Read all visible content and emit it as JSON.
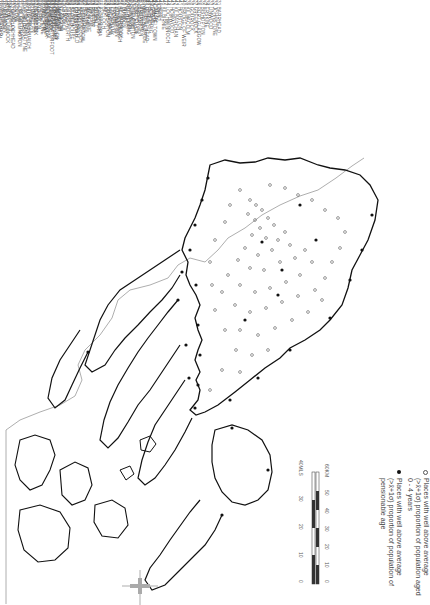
{
  "map": {
    "orientation": "rotated 90 degrees clockwise",
    "coast_color": "#1a1a1a",
    "boundary_color": "#888888"
  },
  "legend": {
    "items": [
      {
        "marker": "open-circle",
        "text": "Places with well above average (>x̄+1σ) proportion of population aged 0 - 4 years"
      },
      {
        "marker": "filled-circle",
        "text": "Places with well above average (>x̄+1σ) proportion of population of pensionable age"
      }
    ]
  },
  "scale": {
    "miles_label": "40MLS",
    "km_label": "60KM",
    "miles_ticks": [
      "0",
      "10",
      "20",
      "30",
      "40MLS"
    ],
    "km_ticks": [
      "0",
      "10",
      "20",
      "30",
      "40",
      "50",
      "60KM"
    ]
  },
  "place_lists": [
    {
      "items": [
        "1 OBAN",
        "2 CAMPBELTOWN",
        "3 ARDRISHAIG",
        "4 LOCHGILPHEAD",
        "5 INVERARAY",
        "6 TARBERT",
        "7 PORT ELLEN",
        "8 BOWMORE",
        "9 ROTHESAY",
        "10 DUNOON",
        "11 HELENSBURGH",
        "12 CARDROSS",
        "13 CLYDEBANK",
        "14 DUMBARTON",
        "15 BALLOCH",
        "16 ALEXANDRIA",
        "17 BONHILL",
        "18 RENTON",
        "19 MILNGAVIE",
        "20 BEARSDEN",
        "21 KIRKINTILLOCH",
        "22 CUMBERNAULD",
        "23 KILSYTH",
        "24 STEPPS",
        "25 LENZIE",
        "26 GLASGOW",
        "27 RUTHERGLEN",
        "28 CAMBUSLANG",
        "29 PAISLEY",
        "30 RENFREW"
      ]
    },
    {
      "items": [
        "31 BARRHEAD",
        "32 JOHNSTONE",
        "33 LINWOOD",
        "34 ERSKINE",
        "35 BISHOPTON",
        "36 PORT GLASGOW",
        "37 GREENOCK",
        "38 GOUROCK",
        "39 KILMACOLM",
        "40 BRIDGE OF WEIR",
        "41 HOUSTON",
        "42 KILBARCHAN",
        "43 HOWWOOD",
        "44 LOCHWINNOCH",
        "45 KILBIRNIE",
        "46 BEITH",
        "47 DALRY",
        "48 LARGS",
        "49 FAIRLIE",
        "50 WEST KILBRIDE",
        "51 ARDROSSAN",
        "52 SALTCOATS",
        "53 STEVENSTON",
        "54 KILWINNING",
        "55 IRVINE",
        "56 KILMARNOCK",
        "57 STEWARTON",
        "58 TROON",
        "59 PRESTWICK",
        "60 AYR"
      ]
    },
    {
      "items": [
        "61 MAYBOLE",
        "62 GIRVAN",
        "63 CUMNOCK",
        "64 AUCHINLECK",
        "65 MAUCHLINE",
        "66 GALSTON",
        "67 NEWMILNS",
        "68 DARVEL",
        "69 HURLFORD",
        "70 KILMAURS",
        "71 DALMELLINGTON",
        "72 PATNA",
        "73 DRONGAN",
        "74 NEW CUMNOCK",
        "75 MUIRKIRK",
        "76 STRATHAVEN",
        "77 EAST KILBRIDE",
        "78 HAMILTON",
        "79 MOTHERWELL",
        "80 WISHAW",
        "81 COATBRIDGE",
        "82 AIRDRIE",
        "83 BELLSHILL",
        "84 UDDINGSTON",
        "85 BOTHWELL",
        "86 BLANTYRE",
        "87 LARKHALL",
        "88 CARLUKE",
        "89 LANARK",
        "90 BIGGAR"
      ]
    },
    {
      "items": [
        "91 CARSTAIRS",
        "92 FORTH",
        "93 SHOTTS",
        "94 HARTHILL",
        "95 LESMAHAGOW",
        "96 DOUGLAS",
        "97 CROSSFORD",
        "98 STONEHOUSE",
        "99 LARGS NORTH",
        "100 BRODICK",
        "101 LAMLASH",
        "102 WHITING BAY",
        "103 BLACKWATERFOOT",
        "104 LOCHRANZA",
        "105 MILLPORT",
        "106 KIRN",
        "107 SANDBANK",
        "108 INNELLAN",
        "109 TIGHNABRUAICH",
        "110 PORT BANNATYNE",
        "111 KILCREGGAN",
        "112 COVE",
        "113 GARELOCHHEAD",
        "114 RHU",
        "115 SHANDON",
        "116 ARROCHAR",
        "117 TARBET",
        "118 KILMUN",
        "119 STRONE",
        "120 CLYNDER"
      ]
    }
  ],
  "places": {
    "open_count": 120,
    "filled_count": 30
  }
}
